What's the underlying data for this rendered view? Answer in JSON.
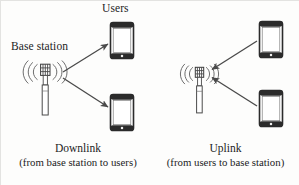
{
  "figure": {
    "type": "network-diagram",
    "background_color": "#fdfdfc",
    "stroke_color": "#3a3a3a"
  },
  "labels": {
    "users": "Users",
    "base_station": "Base station"
  },
  "panels": [
    {
      "id": "downlink",
      "caption_title": "Downlink",
      "caption_sub": "(from base station to users)",
      "direction": "base-station-to-users",
      "tower": {
        "name": "base-station-tower",
        "x": 45,
        "y": 72
      },
      "devices": [
        {
          "name": "user-phone-top",
          "x": 122,
          "y": 44
        },
        {
          "name": "user-phone-bottom",
          "x": 122,
          "y": 113
        }
      ],
      "arrows": [
        {
          "name": "downlink-arrow-top",
          "from": "base-station",
          "to": "user-phone-top"
        },
        {
          "name": "downlink-arrow-bottom",
          "from": "base-station",
          "to": "user-phone-bottom"
        }
      ]
    },
    {
      "id": "uplink",
      "caption_title": "Uplink",
      "caption_sub": "(from users to base station)",
      "direction": "users-to-base-station",
      "tower": {
        "name": "base-station-tower",
        "x": 199,
        "y": 74
      },
      "devices": [
        {
          "name": "user-phone-top",
          "x": 271,
          "y": 42
        },
        {
          "name": "user-phone-bottom",
          "x": 271,
          "y": 110
        }
      ],
      "arrows": [
        {
          "name": "uplink-arrow-top",
          "from": "user-phone-top",
          "to": "base-station"
        },
        {
          "name": "uplink-arrow-bottom",
          "from": "user-phone-bottom",
          "to": "base-station"
        }
      ]
    }
  ],
  "icons": {
    "tower": "cell-tower-icon",
    "phone": "smartphone-icon",
    "signal": "radio-wave-icon",
    "arrow": "arrow-icon"
  }
}
